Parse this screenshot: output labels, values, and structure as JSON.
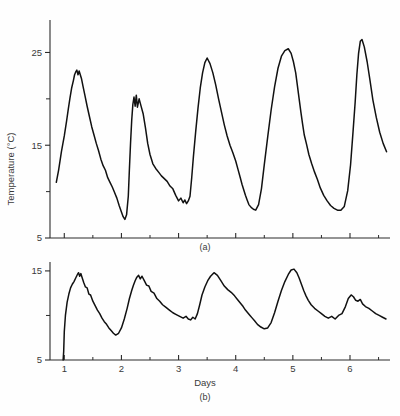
{
  "figure": {
    "background": "#fefefe",
    "line_color": "#111111",
    "text_color": "#3a3a3a"
  },
  "chart_data": [
    {
      "type": "line",
      "panel": "a",
      "panel_label": "(a)",
      "title": "",
      "xlabel": "",
      "ylabel": "Temperature (°C)",
      "xlim": [
        0.75,
        6.7
      ],
      "ylim": [
        5,
        28.5
      ],
      "grid": false,
      "legend": "none",
      "xticks": [
        1,
        2,
        3,
        4,
        5,
        6
      ],
      "xtick_labels": [
        "",
        "",
        "",
        "",
        "",
        ""
      ],
      "xticks_minor": [
        1.5,
        2.5,
        3.5,
        4.5,
        5.5,
        6.5
      ],
      "yticks": [
        5,
        15,
        25
      ],
      "ytick_labels": [
        "5",
        "15",
        "25"
      ],
      "yticks_minor": [
        10,
        20
      ],
      "series": [
        {
          "name": "Temperature (a)",
          "x": [
            0.86,
            0.9,
            0.95,
            1.0,
            1.04,
            1.07,
            1.1,
            1.13,
            1.16,
            1.18,
            1.2,
            1.22,
            1.24,
            1.26,
            1.28,
            1.3,
            1.33,
            1.36,
            1.4,
            1.44,
            1.48,
            1.52,
            1.56,
            1.6,
            1.64,
            1.68,
            1.72,
            1.76,
            1.8,
            1.84,
            1.88,
            1.92,
            1.96,
            2.0,
            2.03,
            2.06,
            2.09,
            2.12,
            2.14,
            2.16,
            2.18,
            2.2,
            2.22,
            2.24,
            2.26,
            2.28,
            2.31,
            2.34,
            2.38,
            2.42,
            2.46,
            2.5,
            2.55,
            2.6,
            2.65,
            2.7,
            2.75,
            2.8,
            2.85,
            2.9,
            2.95,
            3.0,
            3.04,
            3.08,
            3.11,
            3.14,
            3.17,
            3.2,
            3.23,
            3.26,
            3.3,
            3.34,
            3.38,
            3.42,
            3.46,
            3.5,
            3.55,
            3.6,
            3.65,
            3.7,
            3.75,
            3.8,
            3.85,
            3.9,
            3.95,
            4.0,
            4.04,
            4.08,
            4.11,
            4.14,
            4.17,
            4.2,
            4.23,
            4.27,
            4.31,
            4.35,
            4.4,
            4.45,
            4.5,
            4.56,
            4.62,
            4.68,
            4.74,
            4.8,
            4.86,
            4.92,
            4.97,
            5.01,
            5.05,
            5.08,
            5.11,
            5.14,
            5.17,
            5.2,
            5.24,
            5.28,
            5.33,
            5.38,
            5.43,
            5.48,
            5.54,
            5.6,
            5.66,
            5.72,
            5.78,
            5.84,
            5.9,
            5.96,
            6.01,
            6.05,
            6.09,
            6.12,
            6.15,
            6.18,
            6.21,
            6.25,
            6.3,
            6.35,
            6.4,
            6.46,
            6.52,
            6.58,
            6.64
          ],
          "y": [
            11.0,
            12.3,
            14.3,
            16.0,
            17.6,
            18.9,
            20.1,
            21.2,
            22.0,
            22.6,
            22.9,
            23.1,
            22.6,
            23.0,
            22.6,
            22.2,
            21.3,
            20.4,
            19.2,
            18.1,
            17.0,
            16.1,
            15.2,
            14.4,
            13.5,
            12.8,
            12.3,
            11.5,
            11.0,
            10.5,
            9.9,
            9.3,
            8.5,
            7.8,
            7.3,
            7.0,
            7.5,
            9.5,
            12.5,
            15.3,
            17.7,
            19.4,
            20.2,
            19.2,
            20.4,
            19.1,
            20.0,
            19.3,
            18.4,
            16.9,
            15.2,
            14.0,
            13.0,
            12.5,
            12.1,
            11.7,
            11.4,
            11.1,
            10.6,
            10.3,
            9.6,
            9.0,
            9.3,
            8.8,
            9.1,
            8.7,
            9.0,
            9.5,
            11.5,
            13.8,
            16.5,
            19.0,
            21.2,
            22.8,
            23.9,
            24.4,
            23.8,
            22.8,
            21.5,
            20.0,
            18.6,
            17.2,
            16.0,
            15.0,
            14.2,
            13.3,
            12.4,
            11.5,
            10.8,
            10.2,
            9.6,
            9.1,
            8.6,
            8.3,
            8.1,
            8.0,
            8.6,
            10.3,
            12.9,
            15.9,
            18.8,
            21.3,
            23.3,
            24.6,
            25.2,
            25.4,
            24.9,
            24.0,
            22.8,
            21.4,
            20.0,
            18.6,
            17.3,
            16.1,
            15.1,
            14.0,
            13.0,
            12.1,
            11.3,
            10.4,
            9.6,
            9.0,
            8.5,
            8.2,
            8.0,
            8.0,
            8.4,
            10.1,
            12.9,
            16.2,
            19.6,
            22.6,
            24.9,
            26.2,
            26.4,
            25.6,
            24.0,
            22.0,
            19.9,
            18.0,
            16.4,
            15.2,
            14.3,
            13.5,
            12.7,
            12.0
          ],
          "color": "#111111"
        }
      ],
      "peaks": [
        {
          "day": 1.22,
          "value": 23.1
        },
        {
          "day": 2.2,
          "value": 20.4
        },
        {
          "day": 3.5,
          "value": 24.4
        },
        {
          "day": 4.5,
          "value": 25.4
        },
        {
          "day": 5.2,
          "value": 26.4
        }
      ]
    },
    {
      "type": "line",
      "panel": "b",
      "panel_label": "(b)",
      "title": "",
      "xlabel": "Days",
      "ylabel": "Temperature (°C)",
      "xlim": [
        0.75,
        6.7
      ],
      "ylim": [
        5,
        16
      ],
      "grid": false,
      "legend": "none",
      "xticks": [
        1,
        2,
        3,
        4,
        5,
        6
      ],
      "xtick_labels": [
        "1",
        "2",
        "3",
        "4",
        "5",
        "6"
      ],
      "xticks_minor": [
        1.5,
        2.5,
        3.5,
        4.5,
        5.5,
        6.5
      ],
      "yticks": [
        5,
        15
      ],
      "ytick_labels": [
        "5",
        "15"
      ],
      "yticks_minor": [
        10
      ],
      "series": [
        {
          "name": "Temperature (b)",
          "x": [
            0.98,
            0.99,
            1.0,
            1.02,
            1.05,
            1.08,
            1.11,
            1.14,
            1.17,
            1.2,
            1.23,
            1.25,
            1.27,
            1.29,
            1.31,
            1.34,
            1.37,
            1.4,
            1.43,
            1.46,
            1.5,
            1.54,
            1.58,
            1.62,
            1.66,
            1.7,
            1.74,
            1.78,
            1.82,
            1.86,
            1.9,
            1.95,
            2.0,
            2.05,
            2.1,
            2.14,
            2.18,
            2.21,
            2.24,
            2.27,
            2.3,
            2.33,
            2.36,
            2.4,
            2.44,
            2.48,
            2.52,
            2.57,
            2.62,
            2.67,
            2.72,
            2.78,
            2.84,
            2.9,
            2.96,
            3.02,
            3.08,
            3.13,
            3.17,
            3.21,
            3.25,
            3.29,
            3.33,
            3.37,
            3.41,
            3.46,
            3.51,
            3.56,
            3.62,
            3.68,
            3.74,
            3.8,
            3.86,
            3.92,
            3.98,
            4.03,
            4.08,
            4.13,
            4.17,
            4.21,
            4.25,
            4.29,
            4.33,
            4.38,
            4.44,
            4.5,
            4.56,
            4.62,
            4.68,
            4.74,
            4.8,
            4.86,
            4.92,
            4.97,
            5.02,
            5.07,
            5.11,
            5.15,
            5.19,
            5.23,
            5.27,
            5.32,
            5.38,
            5.44,
            5.5,
            5.56,
            5.62,
            5.68,
            5.74,
            5.8,
            5.86,
            5.92,
            5.97,
            6.02,
            6.06,
            6.1,
            6.14,
            6.18,
            6.22,
            6.27,
            6.33,
            6.39,
            6.45,
            6.51,
            6.57,
            6.63
          ],
          "y": [
            5.0,
            6.0,
            8.2,
            10.0,
            11.5,
            12.4,
            13.1,
            13.5,
            13.8,
            14.2,
            14.6,
            14.8,
            14.4,
            14.7,
            14.3,
            13.7,
            13.2,
            13.1,
            12.4,
            12.3,
            11.6,
            11.1,
            10.6,
            10.2,
            9.7,
            9.3,
            9.0,
            8.6,
            8.3,
            8.0,
            7.8,
            8.0,
            8.6,
            9.6,
            10.8,
            11.9,
            12.8,
            13.4,
            13.9,
            14.3,
            14.5,
            14.1,
            14.4,
            13.9,
            13.4,
            13.3,
            12.7,
            12.5,
            11.9,
            11.6,
            11.2,
            10.9,
            10.6,
            10.3,
            10.1,
            9.9,
            9.7,
            9.9,
            9.6,
            9.5,
            9.8,
            9.6,
            10.2,
            11.2,
            12.3,
            13.2,
            13.9,
            14.4,
            14.8,
            14.5,
            13.9,
            13.3,
            12.9,
            12.6,
            12.2,
            11.8,
            11.4,
            11.0,
            10.6,
            10.3,
            10.0,
            9.7,
            9.4,
            9.0,
            8.7,
            8.5,
            8.6,
            9.2,
            10.3,
            11.6,
            12.8,
            13.8,
            14.6,
            15.1,
            15.2,
            14.8,
            14.2,
            13.5,
            12.8,
            12.2,
            11.7,
            11.2,
            10.8,
            10.5,
            10.2,
            9.9,
            9.7,
            9.9,
            9.6,
            10.0,
            10.2,
            11.0,
            11.9,
            12.3,
            12.1,
            11.7,
            11.6,
            11.8,
            11.3,
            11.0,
            10.8,
            10.5,
            10.2,
            10.0,
            9.8,
            9.6
          ],
          "color": "#111111"
        }
      ],
      "peaks": [
        {
          "day": 1.25,
          "value": 14.8
        },
        {
          "day": 2.3,
          "value": 14.5
        },
        {
          "day": 3.62,
          "value": 14.8
        },
        {
          "day": 5.02,
          "value": 15.2
        },
        {
          "day": 6.1,
          "value": 12.3
        }
      ]
    }
  ],
  "labels": {
    "y_axis_title": "Temperature (°C)",
    "x_axis_title": "Days",
    "panel_a": "(a)",
    "panel_b": "(b)"
  }
}
